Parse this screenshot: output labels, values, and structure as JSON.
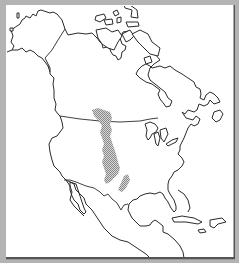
{
  "map": {
    "title": "North America",
    "subject": "Outline map of North America with shaded region",
    "colors": {
      "frame": "#b3b3b3",
      "background": "#ffffff",
      "outline": "#2a2a2a",
      "shaded_region": "#9a9a9a"
    },
    "shaded_region": {
      "label": "Great Plains region (shaded)",
      "pattern": "stipple"
    },
    "regions": [
      "Alaska",
      "Canada",
      "Arctic Archipelago",
      "Greenland (partial)",
      "United States",
      "Mexico",
      "Central America",
      "Caribbean"
    ]
  }
}
